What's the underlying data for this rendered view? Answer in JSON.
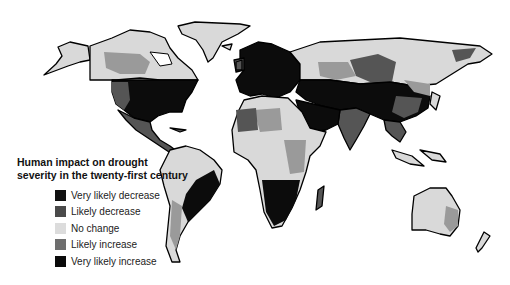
{
  "legend": {
    "title_line1": "Human impact on drought",
    "title_line2": "severity in the twenty-first century",
    "items": [
      {
        "label": "Very likely decrease",
        "color": "#111111"
      },
      {
        "label": "Likely decrease",
        "color": "#4a4a4a"
      },
      {
        "label": "No change",
        "color": "#d9d9d9"
      },
      {
        "label": "Likely increase",
        "color": "#6e6e6e"
      },
      {
        "label": "Very likely increase",
        "color": "#0a0a0a"
      }
    ]
  },
  "colors": {
    "none": "#d9d9d9",
    "mid": "#9a9a9a",
    "dark": "#555555",
    "black": "#0c0c0c",
    "outline": "#000000"
  }
}
